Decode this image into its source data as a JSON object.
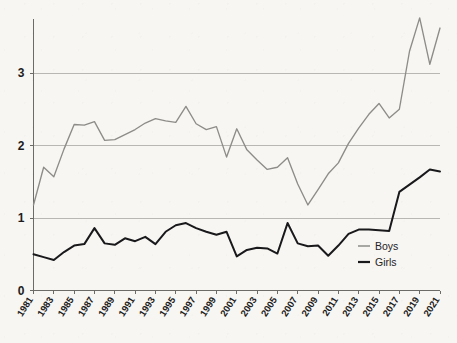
{
  "chart_data": {
    "type": "line",
    "title": "",
    "subtitle": "",
    "xlabel": "",
    "ylabel": "",
    "xlim": [
      1981,
      2021
    ],
    "ylim": [
      0,
      3.9
    ],
    "yticks": [
      0,
      1,
      2,
      3
    ],
    "ytick_labels": [
      "0",
      "1",
      "2",
      "3"
    ],
    "grid": "horizontal",
    "legend_position": "bottom-right",
    "x": [
      1981,
      1982,
      1983,
      1984,
      1985,
      1986,
      1987,
      1988,
      1989,
      1990,
      1991,
      1992,
      1993,
      1994,
      1995,
      1996,
      1997,
      1998,
      1999,
      2000,
      2001,
      2002,
      2003,
      2004,
      2005,
      2006,
      2007,
      2008,
      2009,
      2010,
      2011,
      2012,
      2013,
      2014,
      2015,
      2016,
      2017,
      2018,
      2019,
      2020,
      2021
    ],
    "xtick_labels": [
      "1981",
      "1983",
      "1985",
      "1987",
      "1989",
      "1991",
      "1993",
      "1995",
      "1997",
      "1999",
      "2001",
      "2003",
      "2005",
      "2007",
      "2009",
      "2011",
      "2013",
      "2015",
      "2017",
      "2019",
      "2021"
    ],
    "series": [
      {
        "name": "Boys",
        "color": "#8d8c89",
        "values": [
          1.18,
          1.7,
          1.57,
          1.95,
          2.29,
          2.28,
          2.33,
          2.07,
          2.08,
          2.15,
          2.22,
          2.31,
          2.37,
          2.34,
          2.32,
          2.54,
          2.3,
          2.22,
          2.26,
          1.84,
          2.23,
          1.94,
          1.8,
          1.67,
          1.7,
          1.83,
          1.47,
          1.18,
          1.39,
          1.61,
          1.76,
          2.03,
          2.24,
          2.43,
          2.58,
          2.38,
          2.5,
          3.3,
          3.76,
          3.12,
          3.62
        ]
      },
      {
        "name": "Girls",
        "color": "#19181a",
        "values": [
          0.5,
          0.46,
          0.42,
          0.53,
          0.62,
          0.64,
          0.86,
          0.65,
          0.63,
          0.72,
          0.68,
          0.74,
          0.64,
          0.81,
          0.9,
          0.93,
          0.86,
          0.81,
          0.77,
          0.81,
          0.47,
          0.56,
          0.59,
          0.58,
          0.51,
          0.93,
          0.65,
          0.61,
          0.62,
          0.48,
          0.62,
          0.78,
          0.84,
          0.84,
          0.83,
          0.82,
          1.36,
          1.46,
          1.56,
          1.67,
          1.64
        ]
      }
    ],
    "annotations": []
  },
  "legend": {
    "items": [
      {
        "label": "Boys",
        "color": "#8d8c89"
      },
      {
        "label": "Girls",
        "color": "#19181a"
      }
    ]
  }
}
